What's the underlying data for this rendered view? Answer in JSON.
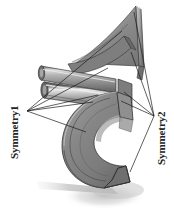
{
  "figure": {
    "background_color": "#ffffff",
    "width": 174,
    "height": 218,
    "type": "technical-3d-illustration"
  },
  "annotations": {
    "left": {
      "label": "Symmetry1",
      "name": "symmetry1-label",
      "rotation_deg": -90,
      "anchor_point": {
        "x": 27,
        "y": 111
      },
      "text_color": "#232323"
    },
    "right": {
      "label": "Symmetry2",
      "name": "symmetry2-label",
      "rotation_deg": -90,
      "anchor_point": {
        "x": 154,
        "y": 116
      },
      "text_color": "#232323"
    }
  },
  "leader_lines": {
    "color": "#1c1c1c",
    "width": 0.7,
    "left_targets": [
      {
        "x": 122,
        "y": 31
      },
      {
        "x": 108,
        "y": 68
      },
      {
        "x": 98,
        "y": 95
      },
      {
        "x": 93,
        "y": 102
      },
      {
        "x": 86,
        "y": 132
      }
    ],
    "right_targets": [
      {
        "x": 134,
        "y": 12
      },
      {
        "x": 131,
        "y": 52
      },
      {
        "x": 124,
        "y": 92
      },
      {
        "x": 121,
        "y": 101
      },
      {
        "x": 130,
        "y": 172
      }
    ]
  },
  "model": {
    "name": "bracket-assembly",
    "parts": [
      {
        "name": "triangular-fin",
        "shade": "#8d8d8d"
      },
      {
        "name": "cylindrical-tube",
        "shade": "#8a8a8a"
      },
      {
        "name": "c-shaped-ring",
        "shade": "#8f8f8f"
      },
      {
        "name": "ground-shadow",
        "shade": "#cfcfcf"
      }
    ],
    "palette": {
      "face_light": "#b4b4b4",
      "face_mid": "#8e8e8e",
      "face_dark": "#6d6d6d",
      "face_darkest": "#575757",
      "edge": "#3a3a3a",
      "highlight": "#e3e3e3",
      "shadow": "#cccccc"
    }
  }
}
